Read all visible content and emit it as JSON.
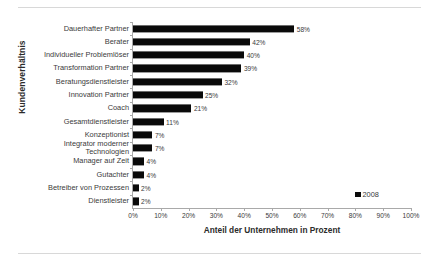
{
  "chart_data": {
    "type": "bar",
    "orientation": "horizontal",
    "title": "",
    "xlabel": "Anteil der Unternehmen in Prozent",
    "ylabel": "Kundenverhältnis",
    "xlim": [
      0,
      100
    ],
    "xtick_labels": [
      "0%",
      "10%",
      "20%",
      "30%",
      "40%",
      "50%",
      "60%",
      "70%",
      "80%",
      "90%",
      "100%"
    ],
    "xticks": [
      0,
      10,
      20,
      30,
      40,
      50,
      60,
      70,
      80,
      90,
      100
    ],
    "grid": false,
    "legend": {
      "position": "bottom-right",
      "entries": [
        {
          "name": "2008",
          "color": "#0a0a0a"
        }
      ]
    },
    "series": [
      {
        "name": "2008",
        "color": "#0a0a0a",
        "categories": [
          "Dauerhafter Partner",
          "Berater",
          "Individueller Problemlöser",
          "Transformation Partner",
          "Beratungsdienstleister",
          "Innovation Partner",
          "Coach",
          "Gesamtdienstleister",
          "Konzeptionist",
          "Integrator moderner Technologien",
          "Manager auf Zeit",
          "Gutachter",
          "Betreiber von Prozessen",
          "Dienstleister"
        ],
        "values": [
          58,
          42,
          40,
          39,
          32,
          25,
          21,
          11,
          7,
          7,
          4,
          4,
          2,
          2
        ],
        "value_labels": [
          "58%",
          "42%",
          "40%",
          "39%",
          "32%",
          "25%",
          "21%",
          "11%",
          "7%",
          "7%",
          "4%",
          "4%",
          "2%",
          "2%"
        ]
      }
    ]
  }
}
